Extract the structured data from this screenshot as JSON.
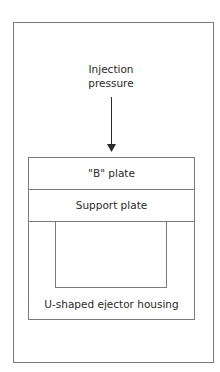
{
  "diagram": {
    "force_label_line1": "Injection",
    "force_label_line2": "pressure",
    "arrow_direction": "down",
    "plates": [
      {
        "label": "\"B\" plate"
      },
      {
        "label": "Support plate"
      },
      {
        "label": "U-shaped ejector housing"
      }
    ],
    "line_color": "#7a7a7a",
    "text_color": "#2a2a2a"
  }
}
